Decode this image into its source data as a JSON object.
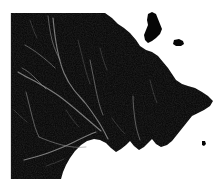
{
  "figure": {
    "type": "raster-map",
    "width_px": 221,
    "height_px": 191,
    "description": "Near-black land surface raster with faint light-grey dendritic river network, bounded by a rectangular data extent on the west, north and south, and an irregular natural coastline on the north-east, east and south-east against white no-data ocean."
  },
  "colors": {
    "land": "#050505",
    "land_texture": "#111111",
    "ocean": "#ffffff",
    "river": "#8f8f8f",
    "background": "#ffffff",
    "frame": "#2a2a2a"
  },
  "legend": {
    "land_label": "Land surface",
    "ocean_label": "Ocean / no data",
    "river_label": "River network"
  },
  "extent": {
    "left_px": 11,
    "top_px": 13,
    "right_px": 213,
    "bottom_px": 179,
    "clipped_edges_label": "West, North and South edges clipped to rectangular tile"
  },
  "features": {
    "peninsula_label": "Northern peninsula",
    "island_large_label": "Offshore island",
    "island_small_label": "Small offshore islet",
    "bay_label": "Southern bay",
    "cape_label": "Eastern cape"
  },
  "chart_data": {
    "type": "heatmap",
    "xlabel": "",
    "ylabel": "",
    "legend_position": "none",
    "grid": false,
    "land_polygon": "M 11 13 L 105 13 L 112 18 L 118 24 L 124 28 L 130 33 L 136 40 L 140 46 L 146 50 L 152 52 L 158 56 L 163 62 L 168 68 L 172 74 L 176 80 L 182 84 L 188 86 L 195 88 L 202 92 L 208 96 L 213 101 L 210 106 L 204 110 L 198 113 L 192 116 L 188 121 L 184 126 L 180 131 L 176 136 L 172 141 L 167 145 L 161 147 L 156 144 L 152 139 L 148 143 L 144 147 L 139 150 L 134 146 L 130 141 L 126 145 L 121 149 L 116 152 L 111 148 L 106 143 L 100 140 L 94 139 L 87 141 L 81 145 L 75 151 L 70 158 L 66 165 L 63 172 L 61 179 L 11 179 Z",
    "islands": [
      {
        "name": "Northern peninsula",
        "path": "M 148 14 L 152 12 L 156 14 L 158 19 L 160 24 L 162 29 L 160 34 L 156 38 L 152 41 L 148 43 L 145 40 L 144 35 L 146 30 L 148 25 L 147 20 Z"
      },
      {
        "name": "Offshore island",
        "path": "M 174 40 L 179 39 L 183 41 L 184 44 L 181 46 L 176 46 L 173 44 Z"
      },
      {
        "name": "Small offshore islet",
        "path": "M 202 141 L 205 141 L 206 144 L 204 146 L 202 145 Z"
      }
    ],
    "rivers": [
      {
        "name": "Main trunk river",
        "class": "river-main",
        "path": "M 53 18 C 54 28, 55 38, 57 48 C 59 58, 61 66, 64 73 C 67 80, 70 85, 74 90 C 78 95, 82 99, 86 104 C 90 109, 94 115, 98 121 C 102 127, 105 133, 108 139"
      },
      {
        "name": "Upper west tributary",
        "class": "river-branch",
        "path": "M 25 45 C 30 48, 35 51, 40 55 C 45 59, 50 63, 55 68"
      },
      {
        "name": "North central tributary",
        "class": "river-branch",
        "path": "M 48 16 C 49 24, 50 32, 52 40 C 54 48, 57 54, 60 60"
      },
      {
        "name": "West highland stream",
        "class": "river-branch",
        "path": "M 22 68 C 26 70, 30 73, 34 77 C 38 81, 42 85, 46 89"
      },
      {
        "name": "Mid basin tributary",
        "class": "river-main",
        "path": "M 18 72 C 24 76, 31 79, 38 83 C 45 87, 52 91, 59 96 C 66 101, 73 107, 80 113 C 87 119, 94 125, 101 131"
      },
      {
        "name": "South west tributary",
        "class": "river-branch",
        "path": "M 26 92 C 28 100, 30 108, 32 116 C 34 124, 36 131, 39 137"
      },
      {
        "name": "Lower basin trunk",
        "class": "river-main",
        "path": "M 24 160 C 32 158, 40 156, 48 153 C 56 150, 64 147, 72 143 C 80 139, 88 135, 96 132"
      },
      {
        "name": "Southern confluence",
        "class": "river-branch",
        "path": "M 39 137 C 46 140, 54 143, 62 145 C 70 147, 78 148, 86 147"
      },
      {
        "name": "East central tributary",
        "class": "river-branch",
        "path": "M 90 60 C 92 70, 94 80, 96 90 C 98 100, 100 108, 103 115"
      },
      {
        "name": "Far east tributary",
        "class": "river-branch",
        "path": "M 133 96 C 133 104, 134 112, 135 120 C 136 128, 138 134, 140 140"
      },
      {
        "name": "Upper east stream",
        "class": "river-minor",
        "path": "M 78 40 C 80 48, 82 56, 84 64 C 86 72, 88 78, 90 84"
      },
      {
        "name": "North east stream",
        "class": "river-minor",
        "path": "M 100 48 C 102 56, 104 63, 107 70"
      },
      {
        "name": "East coastal stream",
        "class": "river-minor",
        "path": "M 150 80 C 152 88, 154 96, 157 103"
      },
      {
        "name": "South central stream",
        "class": "river-minor",
        "path": "M 66 110 C 70 116, 74 122, 79 127"
      },
      {
        "name": "West margin stream",
        "class": "river-minor",
        "path": "M 14 110 C 18 114, 22 118, 27 122"
      },
      {
        "name": "South east stream",
        "class": "river-minor",
        "path": "M 112 118 C 116 124, 120 129, 125 134"
      },
      {
        "name": "North west stream",
        "class": "river-minor",
        "path": "M 30 20 C 32 26, 34 32, 37 38"
      },
      {
        "name": "Lower south stream",
        "class": "river-minor",
        "path": "M 46 166 C 52 164, 58 162, 64 159"
      }
    ]
  }
}
